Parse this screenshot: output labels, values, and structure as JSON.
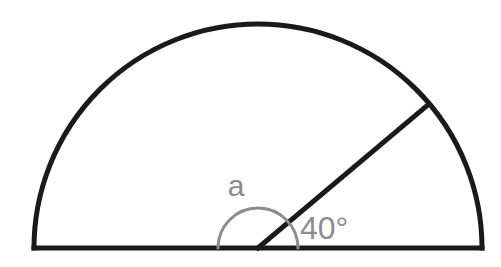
{
  "figure": {
    "background_color": "#ffffff",
    "width": 501,
    "height": 267
  },
  "style": {
    "outline_color": "#1a1a1a",
    "outline_width": 5,
    "marking_color": "#8c8c8c",
    "marking_width": 3,
    "label_color": "#8c8c8c"
  },
  "geometry": {
    "center": {
      "x": 258,
      "y": 248
    },
    "radius": 224,
    "baseline": {
      "left": {
        "x": 34,
        "y": 248
      },
      "right": {
        "x": 482,
        "y": 248
      }
    },
    "radius_line": {
      "from": {
        "x": 258,
        "y": 248
      },
      "to": {
        "x": 429,
        "y": 104
      },
      "angle_from_baseline_deg": 40
    },
    "angle_arc": {
      "radius": 40,
      "start_angle_deg": 180,
      "end_angle_deg": 0
    }
  },
  "labels": {
    "unknown_angle": {
      "text": "a",
      "x": 236,
      "y": 196,
      "font_size": 30,
      "color": "#8c8c8c"
    },
    "known_angle": {
      "text": "40°",
      "x": 300,
      "y": 239,
      "font_size": 32,
      "color": "#8c8c8c"
    }
  },
  "chart_data": {
    "type": "diagram",
    "shape": "semicircle",
    "angles": [
      {
        "name": "a",
        "label": "a",
        "value": null,
        "unit": "degrees",
        "known": false
      },
      {
        "name": "known",
        "label": "40°",
        "value": 40,
        "unit": "degrees",
        "known": true
      }
    ]
  }
}
